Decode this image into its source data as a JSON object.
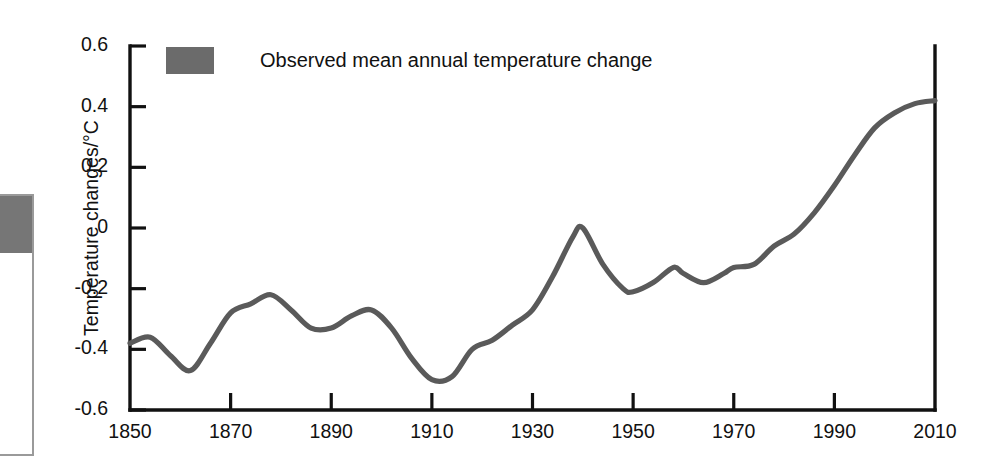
{
  "chart_data": {
    "type": "line",
    "title": "",
    "xlabel": "",
    "ylabel": "Temperature changes/°C",
    "xlim": [
      1850,
      2010
    ],
    "ylim": [
      -0.6,
      0.6
    ],
    "grid": false,
    "legend_position": "top-left",
    "x_ticks": [
      "1850",
      "1870",
      "1890",
      "1910",
      "1930",
      "1950",
      "1970",
      "1990",
      "2010"
    ],
    "y_ticks": [
      "0.6",
      "0.4",
      "0.2",
      "0",
      "-0.2",
      "-0.4",
      "-0.6"
    ],
    "series": [
      {
        "name": "Observed mean annual temperature change",
        "color": "#5a5a5a",
        "units": "°C",
        "x": [
          1850,
          1854,
          1858,
          1862,
          1866,
          1870,
          1874,
          1878,
          1882,
          1886,
          1890,
          1894,
          1898,
          1902,
          1906,
          1910,
          1914,
          1918,
          1922,
          1926,
          1930,
          1934,
          1938,
          1940,
          1944,
          1948,
          1950,
          1954,
          1958,
          1960,
          1964,
          1968,
          1970,
          1974,
          1978,
          1982,
          1986,
          1990,
          1994,
          1998,
          2002,
          2006,
          2010
        ],
        "y": [
          -0.38,
          -0.36,
          -0.42,
          -0.47,
          -0.38,
          -0.28,
          -0.25,
          -0.22,
          -0.27,
          -0.33,
          -0.33,
          -0.29,
          -0.27,
          -0.33,
          -0.43,
          -0.5,
          -0.49,
          -0.4,
          -0.37,
          -0.32,
          -0.27,
          -0.16,
          -0.03,
          0.0,
          -0.12,
          -0.2,
          -0.21,
          -0.18,
          -0.13,
          -0.15,
          -0.18,
          -0.15,
          -0.13,
          -0.12,
          -0.06,
          -0.02,
          0.05,
          0.14,
          0.24,
          0.33,
          0.38,
          0.41,
          0.42
        ]
      }
    ],
    "annotations": []
  },
  "legend": {
    "label": "Observed mean annual temperature change",
    "swatch_color": "#6b6b6b"
  },
  "axes": {
    "y_title": "Temperature changes/°C",
    "axis_color": "#111111"
  },
  "artifact": {
    "name": "adjacent-figure-edge",
    "fill_color": "#767676",
    "border_color": "#9a9a9a"
  }
}
